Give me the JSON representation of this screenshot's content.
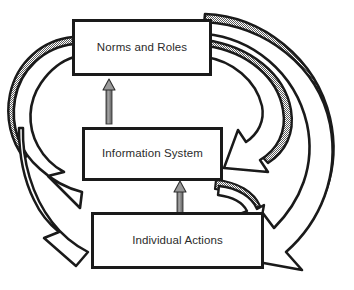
{
  "diagram": {
    "type": "cyclic-block-diagram",
    "background_color": "#ffffff",
    "box_border_color": "#1a1a1a",
    "box_fill_color": "#ffffff",
    "text_color": "#2b2b2b",
    "arrow_outline_color": "#1a1a1a",
    "arrow_fill_color": "#ffffff",
    "shadow_fill_color": "#8c8c8c",
    "thin_arrow_color": "#7d7d7d",
    "nodes": [
      {
        "id": "norms-and-roles",
        "label": "Norms and Roles",
        "position": "top"
      },
      {
        "id": "information-system",
        "label": "Information System",
        "position": "middle"
      },
      {
        "id": "individual-actions",
        "label": "Individual Actions",
        "position": "bottom"
      }
    ],
    "connectors": [
      {
        "id": "infosys-to-norms",
        "from": "information-system",
        "to": "norms-and-roles",
        "style": "thin-vertical-arrow",
        "direction": "up"
      },
      {
        "id": "actions-to-infosys",
        "from": "individual-actions",
        "to": "information-system",
        "style": "thin-vertical-arrow",
        "direction": "up"
      },
      {
        "id": "norms-to-actions-left",
        "from": "norms-and-roles",
        "to": "individual-actions",
        "style": "curved-block-arrow",
        "side": "left",
        "shadowed": true
      },
      {
        "id": "norms-to-actions-right",
        "from": "norms-and-roles",
        "to": "individual-actions",
        "style": "curved-block-arrow",
        "side": "right-outer",
        "shadowed": true
      },
      {
        "id": "norms-to-infosys-right",
        "from": "norms-and-roles",
        "to": "information-system",
        "style": "curved-block-arrow",
        "side": "right-inner",
        "shadowed": true
      },
      {
        "id": "infosys-to-actions-right",
        "from": "information-system",
        "to": "individual-actions",
        "style": "curved-block-arrow",
        "side": "right-short",
        "shadowed": true
      }
    ]
  }
}
